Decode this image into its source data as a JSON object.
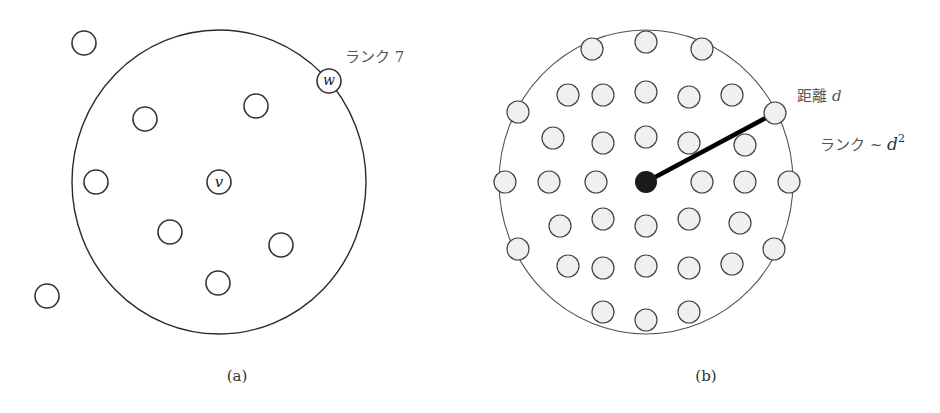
{
  "panel_a": {
    "caption": "(a)",
    "rank_label": "ランク 7",
    "center_node_label": "v",
    "target_node_label": "w",
    "ring": {
      "cx": 219,
      "cy": 182,
      "rx": 147,
      "ry": 152
    },
    "center_node": {
      "cx": 219,
      "cy": 182,
      "r": 12
    },
    "target_node": {
      "cx": 329,
      "cy": 81,
      "r": 12
    },
    "nodes": [
      {
        "cx": 84,
        "cy": 43
      },
      {
        "cx": 145,
        "cy": 119
      },
      {
        "cx": 256,
        "cy": 106
      },
      {
        "cx": 96,
        "cy": 182
      },
      {
        "cx": 170,
        "cy": 232
      },
      {
        "cx": 281,
        "cy": 245
      },
      {
        "cx": 218,
        "cy": 283
      },
      {
        "cx": 47,
        "cy": 296
      }
    ]
  },
  "panel_b": {
    "caption": "(b)",
    "distance_label_prefix": "距離",
    "distance_label_var": "d",
    "rank_label_prefix": "ランク ~ ",
    "rank_label_var": "d",
    "rank_label_exp": "2",
    "ring": {
      "cx": 646,
      "cy": 182,
      "rx": 147,
      "ry": 152
    },
    "center_node": {
      "cx": 646,
      "cy": 182,
      "r": 11,
      "color": "#1a1a1a"
    },
    "radius_line": {
      "x1": 646,
      "y1": 182,
      "x2": 775,
      "y2": 113
    },
    "nodes": [
      {
        "cx": 592,
        "cy": 49
      },
      {
        "cx": 646,
        "cy": 42
      },
      {
        "cx": 702,
        "cy": 49
      },
      {
        "cx": 568,
        "cy": 95
      },
      {
        "cx": 603,
        "cy": 95
      },
      {
        "cx": 646,
        "cy": 92
      },
      {
        "cx": 689,
        "cy": 97
      },
      {
        "cx": 732,
        "cy": 95
      },
      {
        "cx": 518,
        "cy": 112
      },
      {
        "cx": 775,
        "cy": 113
      },
      {
        "cx": 553,
        "cy": 138
      },
      {
        "cx": 603,
        "cy": 143
      },
      {
        "cx": 646,
        "cy": 137
      },
      {
        "cx": 689,
        "cy": 143
      },
      {
        "cx": 745,
        "cy": 145
      },
      {
        "cx": 505,
        "cy": 182
      },
      {
        "cx": 549,
        "cy": 182
      },
      {
        "cx": 596,
        "cy": 182
      },
      {
        "cx": 702,
        "cy": 182
      },
      {
        "cx": 745,
        "cy": 182
      },
      {
        "cx": 789,
        "cy": 182
      },
      {
        "cx": 560,
        "cy": 226
      },
      {
        "cx": 603,
        "cy": 219
      },
      {
        "cx": 646,
        "cy": 226
      },
      {
        "cx": 689,
        "cy": 219
      },
      {
        "cx": 740,
        "cy": 223
      },
      {
        "cx": 518,
        "cy": 249
      },
      {
        "cx": 774,
        "cy": 249
      },
      {
        "cx": 568,
        "cy": 266
      },
      {
        "cx": 603,
        "cy": 268
      },
      {
        "cx": 646,
        "cy": 266
      },
      {
        "cx": 689,
        "cy": 268
      },
      {
        "cx": 732,
        "cy": 264
      },
      {
        "cx": 603,
        "cy": 312
      },
      {
        "cx": 646,
        "cy": 320
      },
      {
        "cx": 689,
        "cy": 312
      }
    ],
    "node_radius": 11
  }
}
